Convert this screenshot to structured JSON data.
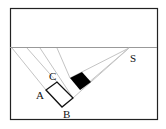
{
  "diagram": {
    "type": "geometry-projection",
    "labels": {
      "A": "A",
      "B": "B",
      "C": "C",
      "S": "S"
    },
    "colors": {
      "frame": "#222222",
      "rays": "#bbbbbb",
      "horizon": "#999999",
      "shadow": "#000000"
    }
  }
}
